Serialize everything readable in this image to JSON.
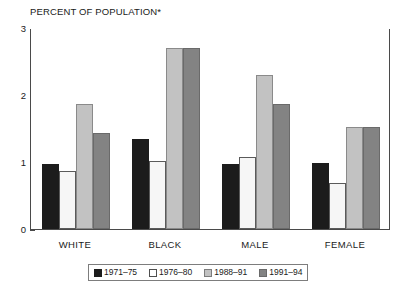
{
  "chart_data": {
    "type": "bar",
    "title": "PERCENT OF POPULATION*",
    "xlabel": "",
    "ylabel": "",
    "ylim": [
      0,
      3
    ],
    "yticks": [
      0,
      1,
      2,
      3
    ],
    "ytick_labels": [
      "0",
      "1",
      "2",
      "3"
    ],
    "grid": false,
    "legend_position": "bottom",
    "categories": [
      "WHITE",
      "BLACK",
      "MALE",
      "FEMALE"
    ],
    "series": [
      {
        "name": "1971–75",
        "color": "#1c1c1c",
        "values": [
          0.97,
          1.35,
          0.97,
          0.99
        ]
      },
      {
        "name": "1976–80",
        "color": "#f6f6f6",
        "values": [
          0.86,
          1.02,
          1.07,
          0.68
        ]
      },
      {
        "name": "1988–91",
        "color": "#c2c2c2",
        "values": [
          1.87,
          2.7,
          2.3,
          1.52
        ]
      },
      {
        "name": "1991–94",
        "color": "#838383",
        "values": [
          1.44,
          2.7,
          1.87,
          1.52
        ]
      }
    ]
  },
  "axis": {
    "y_labels": [
      "3",
      "2",
      "1",
      "0"
    ]
  },
  "legend": {
    "items": [
      {
        "label": "1971–75"
      },
      {
        "label": "1976–80"
      },
      {
        "label": "1988–91"
      },
      {
        "label": "1991–94"
      }
    ]
  }
}
